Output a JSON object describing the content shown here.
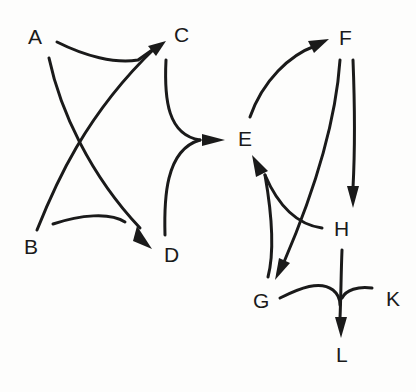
{
  "diagram": {
    "type": "directed-graph",
    "colors": {
      "background": "#fdfdfc",
      "ink": "#1a1a1a"
    },
    "nodes": [
      {
        "id": "A",
        "label": "A"
      },
      {
        "id": "B",
        "label": "B"
      },
      {
        "id": "C",
        "label": "C"
      },
      {
        "id": "D",
        "label": "D"
      },
      {
        "id": "E",
        "label": "E"
      },
      {
        "id": "F",
        "label": "F"
      },
      {
        "id": "G",
        "label": "G"
      },
      {
        "id": "H",
        "label": "H"
      },
      {
        "id": "K",
        "label": "K"
      },
      {
        "id": "L",
        "label": "L"
      }
    ],
    "edges": [
      {
        "from": "A",
        "to": "C"
      },
      {
        "from": "B",
        "to": "C"
      },
      {
        "from": "A",
        "to": "D"
      },
      {
        "from": "B",
        "to": "D"
      },
      {
        "from": "C",
        "to": "E"
      },
      {
        "from": "D",
        "to": "E"
      },
      {
        "from": "E",
        "to": "F"
      },
      {
        "from": "F",
        "to": "G"
      },
      {
        "from": "F",
        "to": "H"
      },
      {
        "from": "G",
        "to": "E"
      },
      {
        "from": "H",
        "to": "E"
      },
      {
        "from": "H",
        "to": "L"
      },
      {
        "from": "G",
        "to": "L"
      },
      {
        "from": "K",
        "to": "L"
      }
    ]
  }
}
